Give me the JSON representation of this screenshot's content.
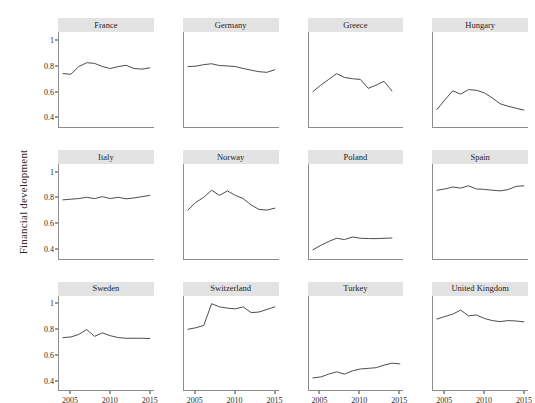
{
  "chart_data": {
    "type": "line",
    "title": "",
    "subtitle": "",
    "xlabel": "",
    "ylabel": "Financial development",
    "facet_layout": {
      "rows": 3,
      "cols": 4
    },
    "grid": false,
    "legend": "none",
    "line_color": "#4d4d4d",
    "strip_color": "#e3e3e3",
    "xlim": [
      2003.5,
      2015.5
    ],
    "ylim": [
      0.32,
      1.06
    ],
    "yticks": [
      1,
      0.8,
      0.6,
      0.4
    ],
    "ytick_labels": [
      "1",
      "0.8",
      "0.6",
      "0.4"
    ],
    "xticks": [
      2005,
      2010,
      2015
    ],
    "xtick_labels": [
      "2005",
      "2010",
      "2015"
    ],
    "x": [
      2004,
      2005,
      2006,
      2007,
      2008,
      2009,
      2010,
      2011,
      2012,
      2013,
      2014,
      2015
    ],
    "series": [
      {
        "name": "France",
        "values": [
          0.735,
          0.73,
          0.79,
          0.82,
          0.815,
          0.79,
          0.775,
          0.79,
          0.8,
          0.775,
          0.77,
          0.78
        ]
      },
      {
        "name": "Germany",
        "values": [
          0.79,
          0.793,
          0.805,
          0.812,
          0.798,
          0.795,
          0.79,
          0.775,
          0.762,
          0.75,
          0.745,
          0.765
        ]
      },
      {
        "name": "Greece",
        "values": [
          0.595,
          0.645,
          0.69,
          0.735,
          0.705,
          0.695,
          0.69,
          0.62,
          0.645,
          0.675,
          0.6,
          null
        ]
      },
      {
        "name": "Hungary",
        "values": [
          0.455,
          0.53,
          0.6,
          0.575,
          0.61,
          0.605,
          0.585,
          0.545,
          0.5,
          0.48,
          0.465,
          0.45
        ]
      },
      {
        "name": "Italy",
        "values": [
          0.78,
          0.785,
          0.79,
          0.8,
          0.79,
          0.805,
          0.79,
          0.8,
          0.788,
          0.795,
          0.805,
          0.815
        ]
      },
      {
        "name": "Norway",
        "values": [
          0.7,
          0.76,
          0.8,
          0.855,
          0.815,
          0.85,
          0.815,
          0.79,
          0.74,
          0.705,
          0.7,
          0.715
        ]
      },
      {
        "name": "Poland",
        "values": [
          0.39,
          0.425,
          0.455,
          0.48,
          0.47,
          0.49,
          0.48,
          0.478,
          0.477,
          0.48,
          0.482,
          null
        ]
      },
      {
        "name": "Spain",
        "values": [
          0.855,
          0.865,
          0.88,
          0.872,
          0.89,
          0.865,
          0.862,
          0.855,
          0.85,
          0.86,
          0.885,
          0.89
        ]
      },
      {
        "name": "Sweden",
        "values": [
          0.735,
          0.74,
          0.76,
          0.798,
          0.745,
          0.772,
          0.75,
          0.735,
          0.73,
          0.73,
          0.73,
          0.728
        ]
      },
      {
        "name": "Switzerland",
        "values": [
          0.8,
          0.812,
          0.83,
          1.0,
          0.975,
          0.965,
          0.96,
          0.975,
          0.93,
          0.935,
          0.955,
          0.975
        ]
      },
      {
        "name": "Turkey",
        "values": [
          0.42,
          0.428,
          0.45,
          0.468,
          0.45,
          0.475,
          0.49,
          0.495,
          0.5,
          0.52,
          0.535,
          0.53
        ]
      },
      {
        "name": "United Kingdom",
        "values": [
          0.88,
          0.9,
          0.918,
          0.95,
          0.905,
          0.912,
          0.885,
          0.868,
          0.86,
          0.868,
          0.865,
          0.858
        ]
      }
    ]
  },
  "axis": {
    "y_title": "Financial development"
  }
}
